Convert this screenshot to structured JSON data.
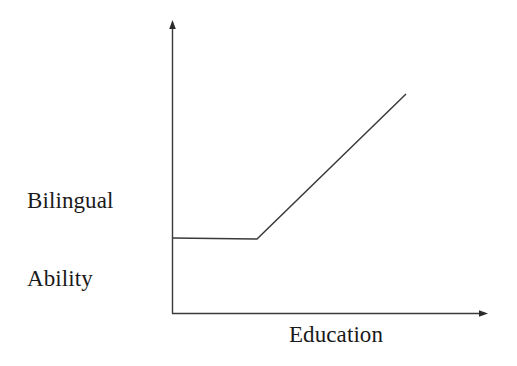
{
  "figure": {
    "background_color": "#ffffff",
    "line_color": "#3a3a3a",
    "text_color": "#1a1a1a",
    "y_axis_label_line1": "Bilingual",
    "y_axis_label_line2": "Ability",
    "x_axis_label": "Education"
  },
  "chart_data": {
    "type": "line",
    "title": "",
    "xlabel": "Education",
    "ylabel": "Bilingual Ability",
    "grid": false,
    "legend": "none",
    "axes": {
      "x_axis_arrow": true,
      "y_axis_arrow": true,
      "x_tick_labels": [],
      "y_tick_labels": [],
      "xlim": [
        0,
        1
      ],
      "ylim": [
        0,
        1
      ]
    },
    "annotations": [],
    "series": [
      {
        "name": "Bilingual ability",
        "description": "Flat at a low constant level across early education, then rising linearly after a threshold",
        "x": [
          0.0,
          0.27,
          0.74
        ],
        "y": [
          0.258,
          0.254,
          0.752
        ],
        "points_px": [
          {
            "x": 172,
            "y": 238
          },
          {
            "x": 257,
            "y": 239
          },
          {
            "x": 406,
            "y": 94
          }
        ]
      }
    ]
  }
}
